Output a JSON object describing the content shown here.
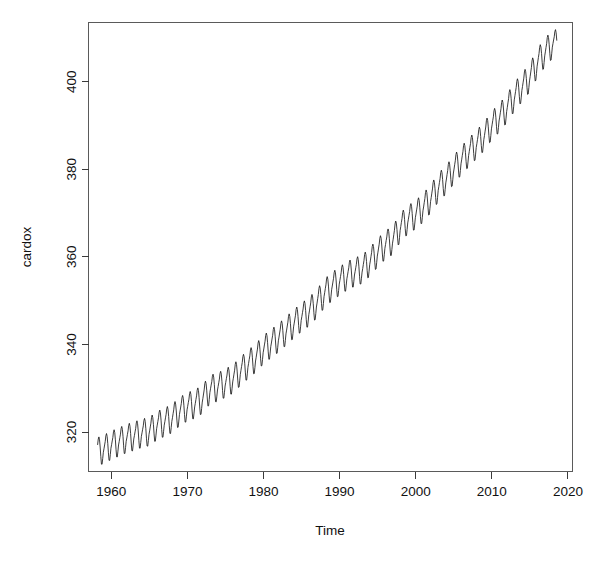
{
  "figure": {
    "background_color": "#ffffff",
    "line_color": "#1a1a1a",
    "axis_color": "#3a3a3a"
  },
  "chart_data": {
    "type": "line",
    "title": "",
    "subtitle": "",
    "xlabel": "Time",
    "ylabel": "cardox",
    "xlim": [
      1957.0,
      2020.6
    ],
    "ylim": [
      311.0,
      413.5
    ],
    "xticks": [
      1960,
      1970,
      1980,
      1990,
      2000,
      2010,
      2020
    ],
    "xtick_labels": [
      "1960",
      "1970",
      "1980",
      "1990",
      "2000",
      "2010",
      "2020"
    ],
    "yticks": [
      320,
      340,
      360,
      380,
      400
    ],
    "ytick_labels": [
      "320",
      "340",
      "360",
      "380",
      "400"
    ],
    "grid": false,
    "legend": null,
    "annotations": [],
    "series": [
      {
        "name": "cardox",
        "description": "Monthly atmospheric carbon dioxide concentration (ppm), Mauna Loa, Mar 1958 - Jul 2018, showing a rising trend with a strong annual seasonal cycle (peak in May, trough in September).",
        "units": "ppm",
        "x_start": 1958.2,
        "x_end": 2018.6,
        "x_step": 0.0833,
        "seasonal_amplitude": 3.2,
        "trend_description": "Keeling curve: accelerating rise from about 315 ppm in 1958 to about 409 ppm in 2018",
        "annual_means": [
          {
            "year": 1958,
            "value": 315.3
          },
          {
            "year": 1959,
            "value": 315.97
          },
          {
            "year": 1960,
            "value": 316.91
          },
          {
            "year": 1961,
            "value": 317.64
          },
          {
            "year": 1962,
            "value": 318.45
          },
          {
            "year": 1963,
            "value": 318.99
          },
          {
            "year": 1964,
            "value": 319.62
          },
          {
            "year": 1965,
            "value": 320.04
          },
          {
            "year": 1966,
            "value": 321.38
          },
          {
            "year": 1967,
            "value": 322.16
          },
          {
            "year": 1968,
            "value": 323.04
          },
          {
            "year": 1969,
            "value": 324.62
          },
          {
            "year": 1970,
            "value": 325.68
          },
          {
            "year": 1971,
            "value": 326.32
          },
          {
            "year": 1972,
            "value": 327.45
          },
          {
            "year": 1973,
            "value": 329.68
          },
          {
            "year": 1974,
            "value": 330.18
          },
          {
            "year": 1975,
            "value": 331.11
          },
          {
            "year": 1976,
            "value": 332.04
          },
          {
            "year": 1977,
            "value": 333.83
          },
          {
            "year": 1978,
            "value": 335.4
          },
          {
            "year": 1979,
            "value": 336.84
          },
          {
            "year": 1980,
            "value": 338.75
          },
          {
            "year": 1981,
            "value": 340.11
          },
          {
            "year": 1982,
            "value": 341.45
          },
          {
            "year": 1983,
            "value": 343.05
          },
          {
            "year": 1984,
            "value": 344.65
          },
          {
            "year": 1985,
            "value": 346.12
          },
          {
            "year": 1986,
            "value": 347.42
          },
          {
            "year": 1987,
            "value": 349.19
          },
          {
            "year": 1988,
            "value": 351.57
          },
          {
            "year": 1989,
            "value": 353.12
          },
          {
            "year": 1990,
            "value": 354.39
          },
          {
            "year": 1991,
            "value": 355.61
          },
          {
            "year": 1992,
            "value": 356.45
          },
          {
            "year": 1993,
            "value": 357.1
          },
          {
            "year": 1994,
            "value": 358.83
          },
          {
            "year": 1995,
            "value": 360.82
          },
          {
            "year": 1996,
            "value": 362.61
          },
          {
            "year": 1997,
            "value": 363.73
          },
          {
            "year": 1998,
            "value": 366.7
          },
          {
            "year": 1999,
            "value": 368.38
          },
          {
            "year": 2000,
            "value": 369.55
          },
          {
            "year": 2001,
            "value": 371.14
          },
          {
            "year": 2002,
            "value": 373.28
          },
          {
            "year": 2003,
            "value": 375.8
          },
          {
            "year": 2004,
            "value": 377.52
          },
          {
            "year": 2005,
            "value": 379.8
          },
          {
            "year": 2006,
            "value": 381.9
          },
          {
            "year": 2007,
            "value": 383.79
          },
          {
            "year": 2008,
            "value": 385.6
          },
          {
            "year": 2009,
            "value": 387.43
          },
          {
            "year": 2010,
            "value": 389.9
          },
          {
            "year": 2011,
            "value": 391.65
          },
          {
            "year": 2012,
            "value": 393.85
          },
          {
            "year": 2013,
            "value": 396.52
          },
          {
            "year": 2014,
            "value": 398.65
          },
          {
            "year": 2015,
            "value": 400.83
          },
          {
            "year": 2016,
            "value": 404.24
          },
          {
            "year": 2017,
            "value": 406.55
          },
          {
            "year": 2018,
            "value": 408.52
          }
        ],
        "monthly_seasonal_offsets": [
          0.18,
          0.98,
          1.72,
          2.93,
          3.35,
          2.63,
          0.93,
          -1.28,
          -3.09,
          -3.17,
          -1.9,
          -0.55
        ],
        "y_min_observed": 313.2,
        "y_max_observed": 411.3
      }
    ]
  }
}
